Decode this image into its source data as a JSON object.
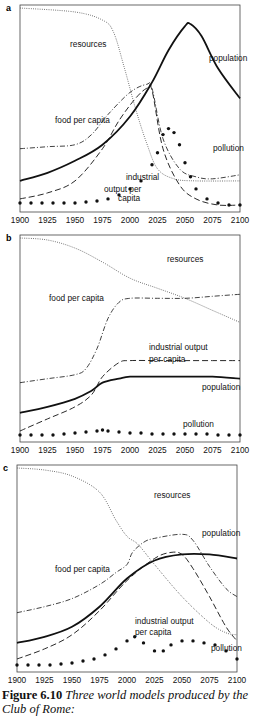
{
  "caption": {
    "figure_label": "Figure 6.10",
    "text": "Three world models produced by the Club of Rome:"
  },
  "chart_data": [
    {
      "panel": "a",
      "type": "line",
      "x_ticks": [
        1900,
        1925,
        1950,
        1975,
        2000,
        2025,
        2050,
        2075,
        2100
      ],
      "xlim": [
        1900,
        2100
      ],
      "ylim": [
        0,
        1
      ],
      "grid": false,
      "labels": [
        {
          "text": "resources",
          "x": 50,
          "y": 42
        },
        {
          "text": "population",
          "x": 189,
          "y": 56
        },
        {
          "text": "food per capita",
          "x": 35,
          "y": 118
        },
        {
          "text": "pollution",
          "x": 193,
          "y": 146
        },
        {
          "text": "industrial",
          "x": 106,
          "y": 175
        },
        {
          "text": "output per",
          "x": 84,
          "y": 187
        },
        {
          "text": "capita",
          "x": 98,
          "y": 196
        }
      ],
      "series": [
        {
          "name": "resources",
          "style": "dotted",
          "x": [
            1900,
            1950,
            1975,
            1985,
            1995,
            2005,
            2015,
            2025,
            2040,
            2060,
            2100
          ],
          "y": [
            1.0,
            0.98,
            0.94,
            0.88,
            0.7,
            0.5,
            0.33,
            0.2,
            0.15,
            0.14,
            0.14
          ]
        },
        {
          "name": "population",
          "style": "solid",
          "x": [
            1900,
            1925,
            1950,
            1975,
            2000,
            2020,
            2035,
            2050,
            2055,
            2065,
            2080,
            2100
          ],
          "y": [
            0.14,
            0.18,
            0.24,
            0.32,
            0.46,
            0.63,
            0.79,
            0.91,
            0.92,
            0.86,
            0.7,
            0.55
          ]
        },
        {
          "name": "food per capita",
          "style": "dashdot",
          "x": [
            1900,
            1925,
            1950,
            1965,
            1980,
            2000,
            2015,
            2020,
            2030,
            2045,
            2060,
            2075,
            2100
          ],
          "y": [
            0.3,
            0.31,
            0.32,
            0.37,
            0.47,
            0.58,
            0.62,
            0.6,
            0.35,
            0.2,
            0.16,
            0.15,
            0.17
          ]
        },
        {
          "name": "industrial output per capita",
          "style": "dashed",
          "x": [
            1900,
            1925,
            1950,
            1975,
            1990,
            2005,
            2015,
            2020,
            2030,
            2045,
            2060,
            2080,
            2100
          ],
          "y": [
            0.05,
            0.08,
            0.14,
            0.3,
            0.44,
            0.55,
            0.6,
            0.59,
            0.3,
            0.12,
            0.05,
            0.02,
            0.02
          ]
        },
        {
          "name": "pollution",
          "style": "dots",
          "x": [
            1900,
            1910,
            1920,
            1930,
            1940,
            1950,
            1960,
            1970,
            1980,
            1990,
            2000,
            2010,
            2020,
            2025,
            2030,
            2035,
            2040,
            2045,
            2050,
            2055,
            2060,
            2070,
            2080,
            2090,
            2100
          ],
          "y": [
            0.03,
            0.03,
            0.03,
            0.03,
            0.03,
            0.03,
            0.035,
            0.04,
            0.05,
            0.07,
            0.1,
            0.14,
            0.22,
            0.28,
            0.37,
            0.4,
            0.38,
            0.32,
            0.23,
            0.16,
            0.1,
            0.05,
            0.03,
            0.02,
            0.02
          ]
        }
      ]
    },
    {
      "panel": "b",
      "type": "line",
      "x_ticks": [
        1900,
        1925,
        1950,
        1975,
        2000,
        2025,
        2050,
        2075,
        2100
      ],
      "xlim": [
        1900,
        2100
      ],
      "ylim": [
        0,
        1
      ],
      "grid": false,
      "labels": [
        {
          "text": "resources",
          "x": 147,
          "y": 27
        },
        {
          "text": "food per capita",
          "x": 29,
          "y": 66
        },
        {
          "text": "industrial output",
          "x": 129,
          "y": 115
        },
        {
          "text": "per capita",
          "x": 129,
          "y": 127
        },
        {
          "text": "population",
          "x": 182,
          "y": 155
        },
        {
          "text": "pollution",
          "x": 163,
          "y": 192
        }
      ],
      "series": [
        {
          "name": "resources",
          "style": "dotted",
          "x": [
            1900,
            1925,
            1950,
            1975,
            2000,
            2025,
            2050,
            2075,
            2100
          ],
          "y": [
            1.0,
            0.99,
            0.95,
            0.88,
            0.8,
            0.75,
            0.7,
            0.64,
            0.58
          ]
        },
        {
          "name": "food per capita",
          "style": "dashdot",
          "x": [
            1900,
            1925,
            1950,
            1960,
            1970,
            1980,
            1990,
            2000,
            2025,
            2050,
            2075,
            2100
          ],
          "y": [
            0.28,
            0.3,
            0.32,
            0.35,
            0.45,
            0.6,
            0.68,
            0.7,
            0.7,
            0.7,
            0.71,
            0.72
          ]
        },
        {
          "name": "industrial output per capita",
          "style": "dashed",
          "x": [
            1900,
            1925,
            1950,
            1965,
            1975,
            1990,
            2000,
            2025,
            2050,
            2075,
            2100
          ],
          "y": [
            0.04,
            0.1,
            0.16,
            0.22,
            0.31,
            0.38,
            0.39,
            0.39,
            0.39,
            0.39,
            0.39
          ]
        },
        {
          "name": "population",
          "style": "solid",
          "x": [
            1900,
            1925,
            1950,
            1965,
            1975,
            1990,
            2000,
            2025,
            2050,
            2075,
            2100
          ],
          "y": [
            0.13,
            0.16,
            0.2,
            0.24,
            0.28,
            0.3,
            0.31,
            0.31,
            0.31,
            0.31,
            0.3
          ]
        },
        {
          "name": "pollution",
          "style": "dots",
          "x": [
            1900,
            1910,
            1920,
            1930,
            1940,
            1950,
            1960,
            1970,
            1975,
            1980,
            1990,
            2000,
            2010,
            2020,
            2030,
            2040,
            2050,
            2060,
            2070,
            2080,
            2090,
            2100
          ],
          "y": [
            0.02,
            0.02,
            0.02,
            0.02,
            0.025,
            0.03,
            0.035,
            0.04,
            0.045,
            0.04,
            0.035,
            0.03,
            0.03,
            0.025,
            0.025,
            0.025,
            0.025,
            0.025,
            0.025,
            0.02,
            0.02,
            0.02
          ]
        }
      ]
    },
    {
      "panel": "c",
      "type": "line",
      "x_ticks": [
        1900,
        1925,
        1950,
        1975,
        2000,
        2025,
        2050,
        2075,
        2100
      ],
      "xlim": [
        1900,
        2100
      ],
      "ylim": [
        0,
        1
      ],
      "grid": false,
      "labels": [
        {
          "text": "resources",
          "x": 137,
          "y": 33
        },
        {
          "text": "population",
          "x": 185,
          "y": 71
        },
        {
          "text": "food per capita",
          "x": 38,
          "y": 107
        },
        {
          "text": "industrial output",
          "x": 118,
          "y": 159
        },
        {
          "text": "per capita",
          "x": 118,
          "y": 170
        },
        {
          "text": "pollution",
          "x": 194,
          "y": 186
        }
      ],
      "series": [
        {
          "name": "resources",
          "style": "dotted",
          "x": [
            1900,
            1925,
            1950,
            1975,
            1990,
            2000,
            2010,
            2025,
            2050,
            2075,
            2090,
            2100
          ],
          "y": [
            1.0,
            0.99,
            0.96,
            0.88,
            0.74,
            0.66,
            0.62,
            0.52,
            0.36,
            0.23,
            0.18,
            0.17
          ]
        },
        {
          "name": "food per capita",
          "style": "dashdot",
          "x": [
            1900,
            1925,
            1950,
            1975,
            1990,
            2000,
            2005,
            2015,
            2025,
            2050,
            2060,
            2075,
            2090,
            2100
          ],
          "y": [
            0.28,
            0.31,
            0.35,
            0.42,
            0.48,
            0.52,
            0.58,
            0.63,
            0.65,
            0.67,
            0.64,
            0.51,
            0.4,
            0.36
          ]
        },
        {
          "name": "industrial output per capita",
          "style": "dashed",
          "x": [
            1900,
            1925,
            1950,
            1975,
            2000,
            2025,
            2040,
            2050,
            2060,
            2075,
            2090,
            2100
          ],
          "y": [
            0.05,
            0.1,
            0.17,
            0.29,
            0.44,
            0.55,
            0.58,
            0.57,
            0.5,
            0.36,
            0.21,
            0.14
          ]
        },
        {
          "name": "population",
          "style": "solid",
          "x": [
            1900,
            1925,
            1950,
            1975,
            2000,
            2025,
            2050,
            2075,
            2100
          ],
          "y": [
            0.13,
            0.16,
            0.21,
            0.31,
            0.45,
            0.54,
            0.57,
            0.57,
            0.55
          ]
        },
        {
          "name": "pollution",
          "style": "dots",
          "x": [
            1900,
            1910,
            1920,
            1930,
            1940,
            1950,
            1960,
            1970,
            1980,
            1990,
            2000,
            2007,
            2015,
            2025,
            2033,
            2040,
            2050,
            2060,
            2070,
            2080,
            2090,
            2100
          ],
          "y": [
            0.02,
            0.02,
            0.02,
            0.02,
            0.025,
            0.03,
            0.04,
            0.05,
            0.07,
            0.1,
            0.14,
            0.16,
            0.13,
            0.09,
            0.09,
            0.12,
            0.14,
            0.14,
            0.13,
            0.12,
            0.09,
            0.05
          ]
        }
      ]
    }
  ]
}
